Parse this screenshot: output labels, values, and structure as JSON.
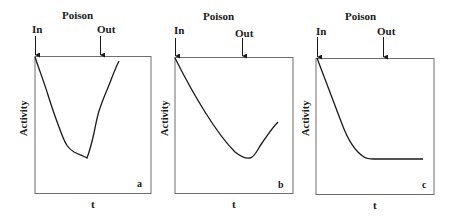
{
  "figure": {
    "panels": [
      {
        "id": "a",
        "title": "Poison",
        "in_label": "In",
        "out_label": "Out",
        "ylabel": "Activity",
        "xlabel": "t",
        "panel_letter": "a",
        "description": "Activity drops after poison in, then recovers sharply after poison out (reversible poisoning)"
      },
      {
        "id": "b",
        "title": "Poison",
        "in_label": "In",
        "out_label": "Out",
        "ylabel": "Activity",
        "xlabel": "t",
        "panel_letter": "b",
        "description": "Activity drops after poison in, then partially recovers slowly after poison out"
      },
      {
        "id": "c",
        "title": "Poison",
        "in_label": "In",
        "out_label": "Out",
        "ylabel": "Activity",
        "xlabel": "t",
        "panel_letter": "c",
        "description": "Activity drops after poison in and stays constant after poison out (irreversible poisoning)"
      }
    ],
    "colors": {
      "line": "#1a1a1a",
      "frame": "#6e6e6e",
      "background": "#ffffff"
    }
  }
}
